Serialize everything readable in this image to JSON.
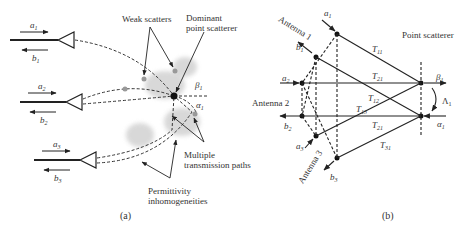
{
  "panel_a": {
    "caption": "(a)",
    "labels": {
      "weak_scatters": "Weak scatters",
      "dominant_line1": "Dominant",
      "dominant_line2": "point scatterer",
      "multiple_line1": "Multiple",
      "multiple_line2": "transmission paths",
      "perm_line1": "Permittivity",
      "perm_line2": "inhomogeneities",
      "beta": "β",
      "alpha": "α",
      "one": "1"
    },
    "antennas": [
      {
        "a": "a",
        "b": "b",
        "idx": "1"
      },
      {
        "a": "a",
        "b": "b",
        "idx": "2"
      },
      {
        "a": "a",
        "b": "b",
        "idx": "3"
      }
    ]
  },
  "panel_b": {
    "caption": "(b)",
    "labels": {
      "antenna1": "Antenna 1",
      "antenna2": "Antenna 2",
      "antenna3": "Antenna 3",
      "point_scatterer": "Point scatterer",
      "T": "T",
      "T11": "11",
      "T21": "21",
      "T12": "12",
      "T13": "13",
      "T31": "31",
      "beta": "β",
      "alpha": "α",
      "Lambda": "Λ",
      "one": "1",
      "a": "a",
      "b": "b",
      "i1": "1",
      "i2": "2",
      "i3": "3"
    }
  }
}
